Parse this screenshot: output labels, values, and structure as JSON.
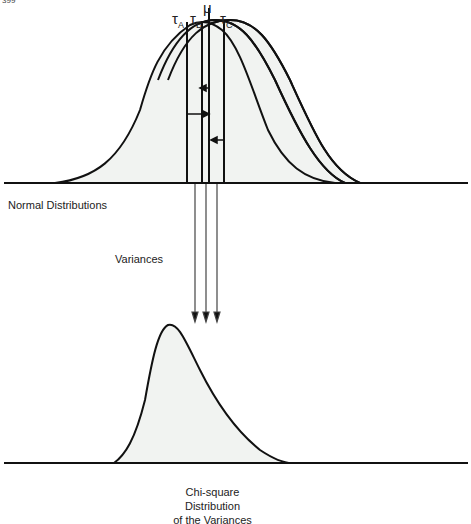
{
  "page_number_fragment": "399",
  "top_panel": {
    "label": "Normal Distributions",
    "mean_symbol": "μ",
    "group_labels": [
      {
        "symbol": "τ",
        "subscript": "A"
      },
      {
        "symbol": "τ",
        "subscript": "B"
      },
      {
        "symbol": "τ",
        "subscript": "C"
      }
    ]
  },
  "arrow_label": "Variances",
  "bottom_panel": {
    "label_lines": [
      "Chi-square",
      "Distribution",
      "of the Variances"
    ]
  },
  "colors": {
    "line": "#111111",
    "fill": "#f1f3f1",
    "background": "#ffffff"
  }
}
